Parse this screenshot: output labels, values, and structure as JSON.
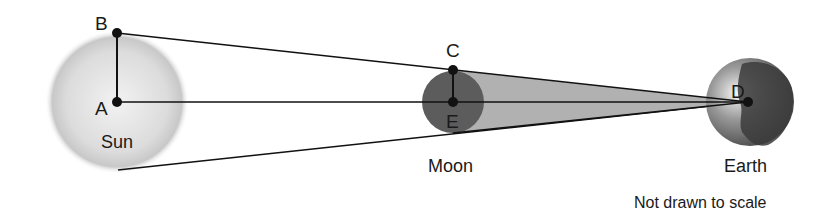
{
  "diagram": {
    "type": "geometry-astronomy",
    "bodies": [
      {
        "name": "Sun",
        "label": "Sun",
        "center": [
          117,
          102
        ],
        "radius": 66
      },
      {
        "name": "Moon",
        "label": "Moon",
        "center": [
          453,
          102
        ],
        "radius": 31
      },
      {
        "name": "Earth",
        "label": "Earth",
        "center": [
          750,
          102
        ],
        "radius": 44
      }
    ],
    "points": [
      {
        "id": "A",
        "label": "A",
        "x": 117,
        "y": 102
      },
      {
        "id": "B",
        "label": "B",
        "x": 117,
        "y": 33
      },
      {
        "id": "C",
        "label": "C",
        "x": 453,
        "y": 70
      },
      {
        "id": "D",
        "label": "D",
        "x": 748,
        "y": 102
      },
      {
        "id": "E",
        "label": "E",
        "x": 453,
        "y": 102
      }
    ],
    "segments": [
      [
        "A",
        "B"
      ],
      [
        "C",
        "E"
      ],
      [
        "B",
        "D"
      ],
      [
        "A",
        "D"
      ]
    ],
    "note": "Not drawn to scale",
    "colors": {
      "sun": "#d4d4d4",
      "moon": "#5a5a5a",
      "shadow": "#a9a9a9",
      "earth_dark": "#3a3a3a",
      "line": "#111111"
    }
  }
}
